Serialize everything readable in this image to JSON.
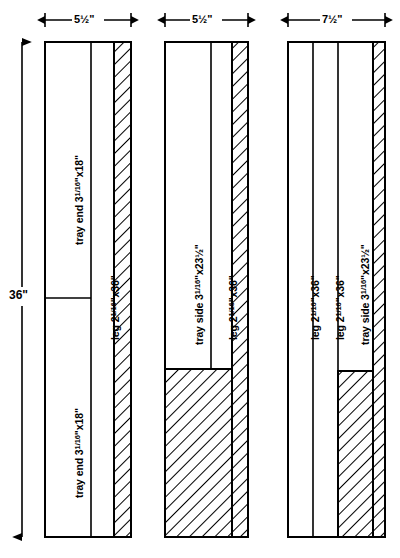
{
  "diagram": {
    "type": "cutting-layout",
    "line_color": "#000000",
    "background_color": "#ffffff",
    "overall_height_label": "36\"",
    "vertical_dimension": {
      "value": "36\"",
      "unit": "inches",
      "measures": "board length"
    },
    "boards": [
      {
        "id": "board-1",
        "width_label": "5½\"",
        "width_value": 5.5,
        "pieces": [
          {
            "id": "board-1-piece-1",
            "label": "tray end 3",
            "fraction": "1/16",
            "label_tail": "\"x18\"",
            "full_label": "tray end 3 1/16\"x18\"",
            "kind": "part"
          },
          {
            "id": "board-1-piece-2",
            "label": "tray end 3",
            "fraction": "1/16",
            "label_tail": "\"x18\"",
            "full_label": "tray end 3 1/16\"x18\"",
            "kind": "part"
          },
          {
            "id": "board-1-piece-3",
            "label": "leg 2",
            "fraction": "1/16",
            "label_tail": "\"x36\"",
            "full_label": "leg 2 1/16\"x36\"",
            "kind": "part"
          },
          {
            "id": "board-1-piece-4",
            "label": "",
            "full_label": "waste",
            "kind": "waste"
          }
        ]
      },
      {
        "id": "board-2",
        "width_label": "5½\"",
        "width_value": 5.5,
        "pieces": [
          {
            "id": "board-2-piece-1",
            "label": "tray side 3",
            "fraction": "1/16",
            "label_tail": "\"x23½\"",
            "full_label": "tray side 3 1/16\"x23½\"",
            "kind": "part"
          },
          {
            "id": "board-2-piece-2",
            "label": "leg 2",
            "fraction": "1/16",
            "label_tail": "\"x36\"",
            "full_label": "leg 2 1/16\"x36\"",
            "kind": "part"
          },
          {
            "id": "board-2-piece-3",
            "label": "",
            "full_label": "waste",
            "kind": "waste"
          }
        ]
      },
      {
        "id": "board-3",
        "width_label": "7½\"",
        "width_value": 7.5,
        "pieces": [
          {
            "id": "board-3-piece-1",
            "label": "leg 2",
            "fraction": "1/16",
            "label_tail": "\"x36\"",
            "full_label": "leg 2 1/16\"x36\"",
            "kind": "part"
          },
          {
            "id": "board-3-piece-2",
            "label": "leg 2",
            "fraction": "1/16",
            "label_tail": "\"x36\"",
            "full_label": "leg 2 1/16\"x36\"",
            "kind": "part"
          },
          {
            "id": "board-3-piece-3",
            "label": "tray side 3",
            "fraction": "1/16",
            "label_tail": "\"x23½\"",
            "full_label": "tray side 3 1/16\"x23½\"",
            "kind": "part"
          },
          {
            "id": "board-3-piece-4",
            "label": "",
            "full_label": "waste",
            "kind": "waste"
          }
        ]
      }
    ]
  }
}
